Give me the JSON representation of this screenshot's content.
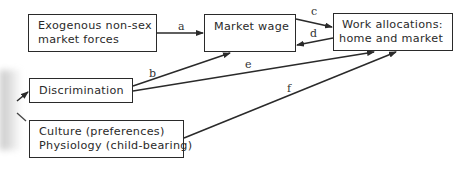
{
  "diagram": {
    "nodes": {
      "exogenous": {
        "lines": [
          "Exogenous non-sex",
          "market forces"
        ]
      },
      "market_wage": {
        "lines": [
          "Market wage"
        ]
      },
      "work_allocations": {
        "lines": [
          "Work allocations:",
          "home and market"
        ]
      },
      "discrimination": {
        "lines": [
          "Discrimination"
        ]
      },
      "culture_physiology": {
        "lines": [
          "Culture (preferences)",
          "Physiology (child-bearing)"
        ]
      }
    },
    "edges": [
      {
        "label": "a",
        "from": "exogenous",
        "to": "market_wage"
      },
      {
        "label": "b",
        "from": "discrimination",
        "to": "market_wage"
      },
      {
        "label": "c",
        "from": "market_wage",
        "to": "work_allocations"
      },
      {
        "label": "d",
        "from": "work_allocations",
        "to": "market_wage"
      },
      {
        "label": "e",
        "from": "discrimination",
        "to": "work_allocations"
      },
      {
        "label": "f",
        "from": "culture_physiology",
        "to": "work_allocations"
      }
    ],
    "colors": {
      "ink": "#2a2a2a",
      "background": "#ffffff"
    }
  }
}
